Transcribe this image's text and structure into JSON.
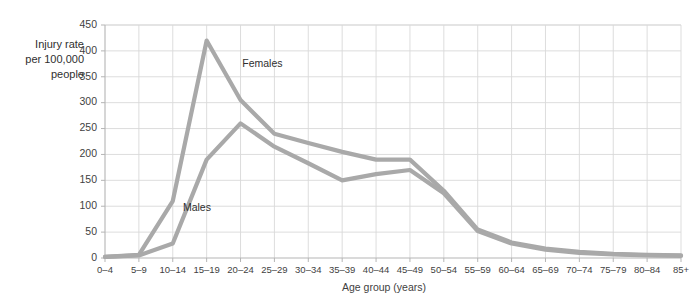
{
  "chart_data": {
    "type": "line",
    "title": "",
    "xlabel": "Age group (years)",
    "ylabel": "Injury rate per 100,000 people",
    "ylabel_lines": [
      "Injury rate",
      "per 100,000",
      "people"
    ],
    "categories": [
      "0–4",
      "5–9",
      "10–14",
      "15–19",
      "20–24",
      "25–29",
      "30–34",
      "35–39",
      "40–44",
      "45–49",
      "50–54",
      "55–59",
      "60–64",
      "65–69",
      "70–74",
      "75–79",
      "80–84",
      "85+"
    ],
    "series": [
      {
        "name": "Females",
        "color": "#a9a9a9",
        "values": [
          2,
          6,
          110,
          420,
          305,
          240,
          222,
          205,
          190,
          190,
          130,
          55,
          30,
          18,
          12,
          8,
          6,
          5
        ],
        "label_x_index": 4.05,
        "label_y_value": 368
      },
      {
        "name": "Males",
        "color": "#a9a9a9",
        "values": [
          2,
          5,
          28,
          190,
          260,
          215,
          183,
          150,
          162,
          170,
          125,
          52,
          28,
          16,
          10,
          7,
          5,
          4
        ],
        "label_x_index": 2.3,
        "label_y_value": 90
      }
    ],
    "ylim": [
      0,
      450
    ],
    "yticks": [
      0,
      50,
      100,
      150,
      200,
      250,
      300,
      350,
      400,
      450
    ],
    "grid": true,
    "grid_x": true,
    "grid_y": true,
    "legend_position": "inline-annotation",
    "axis_color": "#b5b5b5",
    "grid_color": "#d9d9d9",
    "text_color": "#3f3f3f"
  }
}
